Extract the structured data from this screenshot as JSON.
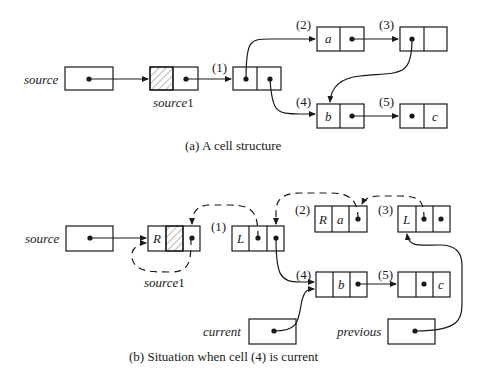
{
  "figure_a": {
    "caption": "(a)  A cell structure",
    "labels": {
      "source": "source",
      "source1": "source",
      "source1_sub": "1",
      "n1": "(1)",
      "n2": "(2)",
      "n3": "(3)",
      "n4": "(4)",
      "n5": "(5)"
    },
    "cells": {
      "c2_val": "a",
      "c4_val": "b",
      "c5_val": "c"
    }
  },
  "figure_b": {
    "caption": "(b)  Situation when cell (4) is current",
    "labels": {
      "source": "source",
      "source1": "source",
      "source1_sub": "1",
      "current": "current",
      "previous": "previous",
      "n1": "(1)",
      "n2": "(2)",
      "n3": "(3)",
      "n4": "(4)",
      "n5": "(5)"
    },
    "cells": {
      "s1_tag": "R",
      "c1_tag": "L",
      "c2_tag": "R",
      "c2_val": "a",
      "c3_tag": "L",
      "c4_val": "b",
      "c5_val": "c"
    }
  }
}
